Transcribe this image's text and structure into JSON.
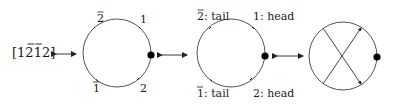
{
  "diagram": {
    "word": "[1̅2̅1̅2]",
    "word_display": "[1 2̅ 1̅ 2]",
    "panels": [
      {
        "id": "circle-with-labels",
        "labels": {
          "top_left": "2̅",
          "top_right": "1",
          "bottom_left": "1̅",
          "bottom_right": "2"
        },
        "has_basepoint": true
      },
      {
        "id": "circle-head-tail",
        "labels": {
          "top_left": "2̅: tail",
          "top_right": "1: head",
          "bottom_left": "1̅: tail",
          "bottom_right": "2: head"
        },
        "has_basepoint": true
      },
      {
        "id": "chord-diagram",
        "chords": [
          {
            "from": "top-left",
            "to": "bottom-right",
            "arrow": "bottom-right"
          },
          {
            "from": "bottom-left",
            "to": "top-right",
            "arrow": "top-right"
          }
        ],
        "has_basepoint": true
      }
    ],
    "connectors": [
      "double-arrow",
      "double-arrow",
      "double-arrow"
    ],
    "colors": {
      "stroke": "#555555",
      "dot": "#000000",
      "text": "#1a1a1a"
    }
  }
}
